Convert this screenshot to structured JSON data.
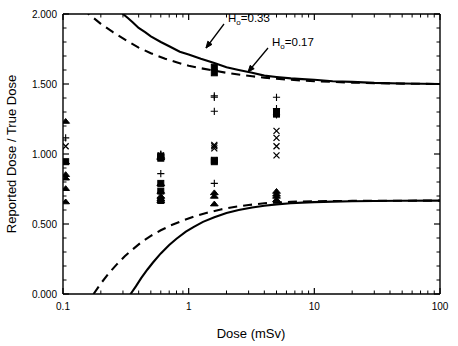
{
  "chart_data": {
    "type": "scatter",
    "title": "",
    "xlabel": "Dose (mSv)",
    "ylabel": "Reported Dose / True Dose",
    "xscale": "log",
    "yscale": "linear",
    "xlim": [
      0.1,
      100
    ],
    "ylim": [
      0.0,
      2.0
    ],
    "grid": false,
    "legend": "none",
    "xticklabels": [
      "0.1",
      "1",
      "10",
      "100"
    ],
    "xtickvalues": [
      0.1,
      1,
      10,
      100
    ],
    "yticklabels": [
      "0.000",
      "0.500",
      "1.000",
      "1.500",
      "2.000"
    ],
    "ytickvalues": [
      0.0,
      0.5,
      1.0,
      1.5,
      2.0
    ],
    "annotations": [
      {
        "id": "ho-033",
        "text": "H",
        "sub": "o",
        "rest": "=0.33",
        "full": "Ho=0.33",
        "x_px": 228,
        "y_px": 22,
        "arrow_to_x_px": 206,
        "arrow_to_y_px": 48
      },
      {
        "id": "ho-017",
        "text": "H",
        "sub": "o",
        "rest": "=0.17",
        "full": "Ho=0.17",
        "x_px": 272,
        "y_px": 46,
        "arrow_to_x_px": 248,
        "arrow_to_y_px": 72
      }
    ],
    "curves": [
      {
        "name": "Ho=0.33 upper bound",
        "style": "solid",
        "ho": 0.33,
        "branch": "upper",
        "asymptote": 1.5,
        "points": [
          [
            0.3,
            2.0
          ],
          [
            0.33,
            1.97
          ],
          [
            0.36,
            1.94
          ],
          [
            0.4,
            1.9
          ],
          [
            0.45,
            1.87
          ],
          [
            0.5,
            1.84
          ],
          [
            0.6,
            1.8
          ],
          [
            0.7,
            1.77
          ],
          [
            0.85,
            1.73
          ],
          [
            1.0,
            1.71
          ],
          [
            1.25,
            1.68
          ],
          [
            1.6,
            1.65
          ],
          [
            2.0,
            1.62
          ],
          [
            2.5,
            1.6
          ],
          [
            3.2,
            1.58
          ],
          [
            4.0,
            1.56
          ],
          [
            5.0,
            1.55
          ],
          [
            6.5,
            1.54
          ],
          [
            8.0,
            1.535
          ],
          [
            10.0,
            1.53
          ],
          [
            14.0,
            1.52
          ],
          [
            20.0,
            1.515
          ],
          [
            30.0,
            1.508
          ],
          [
            50.0,
            1.504
          ],
          [
            100.0,
            1.5
          ]
        ]
      },
      {
        "name": "Ho=0.17 upper bound",
        "style": "dashed",
        "ho": 0.17,
        "branch": "upper",
        "asymptote": 1.5,
        "points": [
          [
            0.1,
            2.2
          ],
          [
            0.13,
            2.08
          ],
          [
            0.16,
            2.0
          ],
          [
            0.2,
            1.93
          ],
          [
            0.25,
            1.87
          ],
          [
            0.32,
            1.81
          ],
          [
            0.4,
            1.76
          ],
          [
            0.5,
            1.72
          ],
          [
            0.65,
            1.68
          ],
          [
            0.8,
            1.655
          ],
          [
            1.0,
            1.63
          ],
          [
            1.3,
            1.61
          ],
          [
            1.6,
            1.595
          ],
          [
            2.0,
            1.58
          ],
          [
            2.6,
            1.565
          ],
          [
            3.2,
            1.555
          ],
          [
            4.0,
            1.545
          ],
          [
            5.0,
            1.538
          ],
          [
            6.5,
            1.53
          ],
          [
            8.0,
            1.525
          ],
          [
            10.0,
            1.52
          ],
          [
            14.0,
            1.515
          ],
          [
            20.0,
            1.51
          ],
          [
            30.0,
            1.506
          ],
          [
            50.0,
            1.503
          ],
          [
            100.0,
            1.5
          ]
        ]
      },
      {
        "name": "Ho=0.33 lower bound",
        "style": "solid",
        "ho": 0.33,
        "branch": "lower",
        "asymptote": 0.667,
        "points": [
          [
            0.345,
            0.0
          ],
          [
            0.38,
            0.055
          ],
          [
            0.42,
            0.115
          ],
          [
            0.47,
            0.175
          ],
          [
            0.52,
            0.225
          ],
          [
            0.6,
            0.29
          ],
          [
            0.7,
            0.35
          ],
          [
            0.8,
            0.395
          ],
          [
            0.95,
            0.445
          ],
          [
            1.1,
            0.48
          ],
          [
            1.3,
            0.515
          ],
          [
            1.6,
            0.548
          ],
          [
            2.0,
            0.578
          ],
          [
            2.5,
            0.6
          ],
          [
            3.2,
            0.618
          ],
          [
            4.0,
            0.63
          ],
          [
            5.0,
            0.64
          ],
          [
            6.5,
            0.648
          ],
          [
            8.0,
            0.653
          ],
          [
            10.0,
            0.656
          ],
          [
            14.0,
            0.66
          ],
          [
            20.0,
            0.662
          ],
          [
            30.0,
            0.664
          ],
          [
            50.0,
            0.666
          ],
          [
            100.0,
            0.667
          ]
        ]
      },
      {
        "name": "Ho=0.17 lower bound",
        "style": "dashed",
        "ho": 0.17,
        "branch": "lower",
        "asymptote": 0.667,
        "points": [
          [
            0.175,
            0.0
          ],
          [
            0.2,
            0.075
          ],
          [
            0.23,
            0.145
          ],
          [
            0.27,
            0.215
          ],
          [
            0.31,
            0.27
          ],
          [
            0.36,
            0.32
          ],
          [
            0.42,
            0.37
          ],
          [
            0.5,
            0.415
          ],
          [
            0.6,
            0.455
          ],
          [
            0.72,
            0.49
          ],
          [
            0.9,
            0.525
          ],
          [
            1.1,
            0.553
          ],
          [
            1.4,
            0.58
          ],
          [
            1.8,
            0.604
          ],
          [
            2.3,
            0.622
          ],
          [
            3.0,
            0.636
          ],
          [
            4.0,
            0.648
          ],
          [
            5.0,
            0.653
          ],
          [
            6.5,
            0.658
          ],
          [
            8.0,
            0.661
          ],
          [
            10.0,
            0.662
          ],
          [
            14.0,
            0.664
          ],
          [
            20.0,
            0.665
          ],
          [
            30.0,
            0.666
          ],
          [
            50.0,
            0.6665
          ],
          [
            100.0,
            0.667
          ]
        ]
      }
    ],
    "series": [
      {
        "name": "triangle",
        "marker": "triangle",
        "points": [
          [
            0.105,
            1.235
          ],
          [
            0.105,
            0.945
          ],
          [
            0.105,
            0.855
          ],
          [
            0.105,
            0.83
          ],
          [
            0.105,
            0.755
          ],
          [
            0.105,
            0.66
          ],
          [
            0.6,
            0.985
          ],
          [
            0.6,
            0.975
          ],
          [
            0.6,
            0.79
          ],
          [
            0.6,
            0.735
          ],
          [
            0.6,
            0.7
          ],
          [
            0.6,
            0.68
          ],
          [
            0.6,
            0.668
          ],
          [
            1.6,
            0.725
          ],
          [
            1.6,
            0.7
          ],
          [
            1.6,
            0.645
          ],
          [
            5.0,
            0.735
          ],
          [
            5.0,
            0.715
          ],
          [
            5.0,
            0.7
          ],
          [
            5.0,
            0.675
          ]
        ]
      },
      {
        "name": "square",
        "marker": "square",
        "points": [
          [
            0.105,
            0.945
          ],
          [
            0.6,
            0.985
          ],
          [
            0.6,
            0.97
          ],
          [
            0.6,
            0.79
          ],
          [
            0.6,
            0.735
          ],
          [
            0.6,
            0.668
          ],
          [
            1.6,
            1.62
          ],
          [
            1.6,
            1.58
          ],
          [
            1.6,
            0.955
          ],
          [
            1.6,
            0.945
          ],
          [
            5.0,
            1.3
          ],
          [
            5.0,
            1.285
          ]
        ]
      },
      {
        "name": "plus",
        "marker": "plus",
        "points": [
          [
            0.105,
            1.115
          ],
          [
            0.6,
            1.0
          ],
          [
            0.6,
            0.995
          ],
          [
            0.6,
            0.985
          ],
          [
            0.6,
            0.86
          ],
          [
            1.6,
            1.415
          ],
          [
            1.6,
            1.405
          ],
          [
            1.6,
            1.305
          ],
          [
            1.6,
            0.79
          ],
          [
            5.0,
            1.405
          ],
          [
            5.0,
            1.325
          ],
          [
            5.0,
            1.28
          ]
        ]
      },
      {
        "name": "cross",
        "marker": "x",
        "points": [
          [
            0.105,
            1.055
          ],
          [
            0.6,
            0.99
          ],
          [
            0.6,
            0.98
          ],
          [
            1.6,
            1.065
          ],
          [
            1.6,
            1.055
          ],
          [
            1.6,
            1.04
          ],
          [
            1.6,
            0.955
          ],
          [
            5.0,
            1.165
          ],
          [
            5.0,
            1.115
          ],
          [
            5.0,
            1.055
          ],
          [
            5.0,
            0.99
          ]
        ]
      }
    ]
  },
  "axes": {
    "x_title": "Dose (mSv)",
    "y_title": "Reported Dose / True Dose"
  }
}
